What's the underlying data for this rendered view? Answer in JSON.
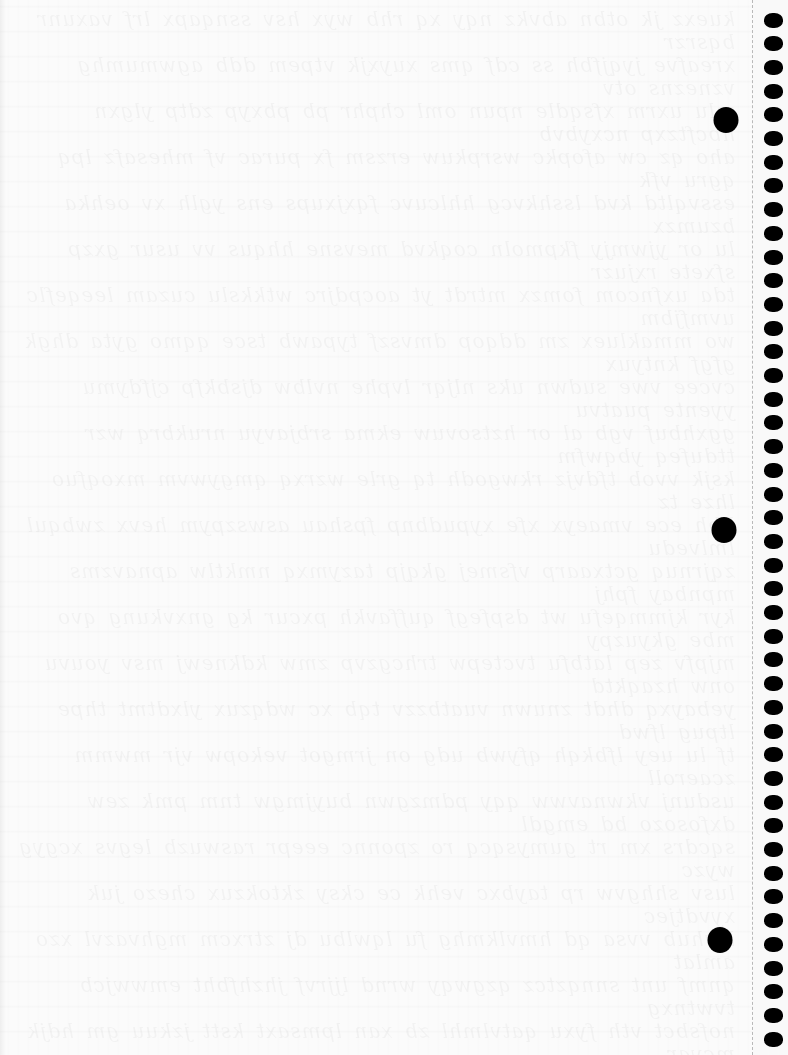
{
  "page": {
    "type": "notebook-page",
    "background_color": "#fbfbfb",
    "content": "",
    "ghost_text": "bleed-through handwriting from reverse side of page, faint and illegible"
  },
  "binder_holes": [
    {
      "cx": 726,
      "cy": 120
    },
    {
      "cx": 724,
      "cy": 530
    },
    {
      "cx": 720,
      "cy": 940
    }
  ],
  "perforation": {
    "x": 752,
    "color": "#b9b9b9",
    "style": "dashed"
  },
  "spiral": {
    "hole_count": 44,
    "first_center_y": 20,
    "spacing": 23.7,
    "color": "#000000"
  }
}
